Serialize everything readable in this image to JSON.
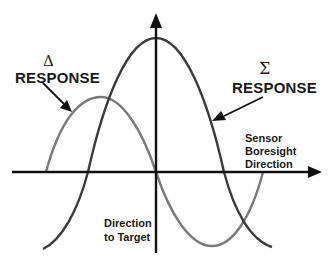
{
  "diagram": {
    "type": "monopulse sum/difference response",
    "labels": {
      "delta_symbol": "Δ",
      "delta_label": "RESPONSE",
      "sigma_symbol": "Σ",
      "sigma_label": "RESPONSE",
      "boresight_line1": "Sensor",
      "boresight_line2": "Boresight",
      "boresight_line3": "Direction",
      "target_line1": "Direction",
      "target_line2": "to Target"
    },
    "curves": [
      {
        "name": "sum-response",
        "symbol": "Σ",
        "color": "#3a3a3a",
        "shape": "cosine peak centered on vertical axis"
      },
      {
        "name": "difference-response",
        "symbol": "Δ",
        "color": "#777777",
        "shape": "sine, zero crossing at vertical axis"
      }
    ],
    "colors": {
      "axis": "#111111",
      "sum_curve": "#3a3a3a",
      "delta_curve": "#777777",
      "text": "#1a1a1a",
      "background": "#ffffff"
    }
  }
}
